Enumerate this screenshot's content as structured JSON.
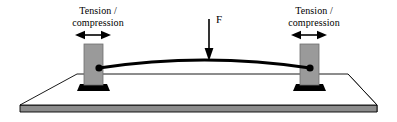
{
  "figure": {
    "background_color": "#ffffff",
    "width": 397,
    "height": 122
  },
  "labels": {
    "left_support": {
      "line1": "Tension /",
      "line2": "compression"
    },
    "right_support": {
      "line1": "Tension /",
      "line2": "compression"
    },
    "force": "F"
  },
  "colors": {
    "outline": "#000000",
    "pillar_fill": "#9a9a9a",
    "pillar_edge": "#6f6f6f",
    "pillar_foot": "#000000",
    "slab_top": "#ffffff",
    "slab_edge_front": "#8c8c8c",
    "slab_edge_right": "#555555",
    "beam": "#000000",
    "arrow": "#000000",
    "text": "#000000"
  },
  "elements": {
    "beam": {
      "name": "curved beam",
      "left_anchor_x": 99,
      "right_anchor_x": 310,
      "anchor_y": 68,
      "apex_y": 60,
      "stroke_width": 2.6
    },
    "force_arrow": {
      "name": "downward force arrow F",
      "x": 209,
      "top_y": 18,
      "tip_y": 60,
      "direction": "down"
    },
    "left_arrow": {
      "name": "horizontal double-headed arrow",
      "center_x": 93,
      "y": 35,
      "half_width": 16,
      "direction": "both"
    },
    "right_arrow": {
      "name": "horizontal double-headed arrow",
      "center_x": 309,
      "y": 35,
      "half_width": 16,
      "direction": "both"
    },
    "left_pillar": {
      "name": "left support column",
      "x": 84,
      "y": 44,
      "width": 19,
      "height": 40
    },
    "right_pillar": {
      "name": "right support column",
      "x": 300,
      "y": 44,
      "width": 19,
      "height": 40
    },
    "slab": {
      "name": "ground platform in perspective",
      "back_left_x": 77,
      "back_right_x": 348,
      "back_y": 74,
      "front_left_x": 20,
      "front_right_x": 377,
      "front_y": 105,
      "thickness": 7
    }
  }
}
